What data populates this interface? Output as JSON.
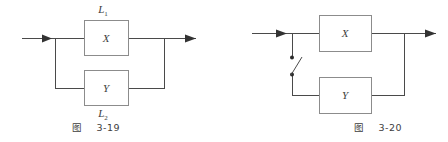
{
  "page": {
    "background_color": "#ffffff",
    "line_color": "#4a4a4a",
    "box_stroke_color": "#8c8c8c",
    "text_color": "#3d3d3d"
  },
  "figures": [
    {
      "id": "fig-3-19",
      "caption": "图    3-19",
      "type": "reliability-block-diagram",
      "description": "parallel system of two blocks",
      "blocks": [
        {
          "name": "X",
          "label": "X",
          "branch_label_base": "L",
          "branch_label_sub": "1",
          "branch_label": "L₁",
          "branch_label_position": "above"
        },
        {
          "name": "Y",
          "label": "Y",
          "branch_label_base": "L",
          "branch_label_sub": "2",
          "branch_label": "L₂",
          "branch_label_position": "below"
        }
      ],
      "input_arrow": true,
      "output_arrow": true,
      "switch": false
    },
    {
      "id": "fig-3-20",
      "caption": "图    3-20",
      "type": "reliability-block-diagram",
      "description": "standby system of two blocks with open switch on lower branch",
      "blocks": [
        {
          "name": "X",
          "label": "X",
          "branch_label": "",
          "branch_label_position": "none"
        },
        {
          "name": "Y",
          "label": "Y",
          "branch_label": "",
          "branch_label_position": "none"
        }
      ],
      "input_arrow": true,
      "output_arrow": true,
      "switch": true,
      "switch_state": "open",
      "switch_name": "standby-switch"
    }
  ]
}
